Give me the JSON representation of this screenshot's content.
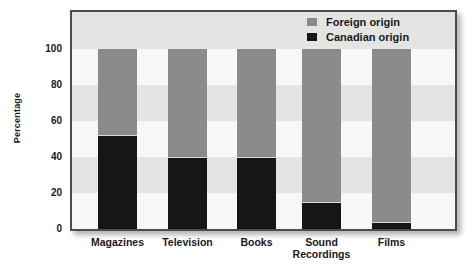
{
  "chart_data": {
    "type": "bar",
    "stacked": true,
    "title": "",
    "xlabel": "",
    "ylabel": "Percentage",
    "categories": [
      "Magazines",
      "Television",
      "Books",
      "Sound Recordings",
      "Films"
    ],
    "series": [
      {
        "name": "Foreign origin",
        "color": "#8b8b89",
        "values": [
          48,
          60,
          60,
          85,
          96
        ]
      },
      {
        "name": "Canadian origin",
        "color": "#161616",
        "values": [
          52,
          40,
          40,
          15,
          4
        ]
      }
    ],
    "y_ticks": [
      100,
      80,
      60,
      40,
      20,
      0
    ],
    "ylim": [
      0,
      110
    ],
    "legend_position": "top-right",
    "grid": "horizontal-bands",
    "colors": {
      "band_light": "#f7f7f5",
      "band_gray": "#e4e4e2",
      "frame_border": "#4c4c4c",
      "text": "#1a1a1a"
    }
  }
}
